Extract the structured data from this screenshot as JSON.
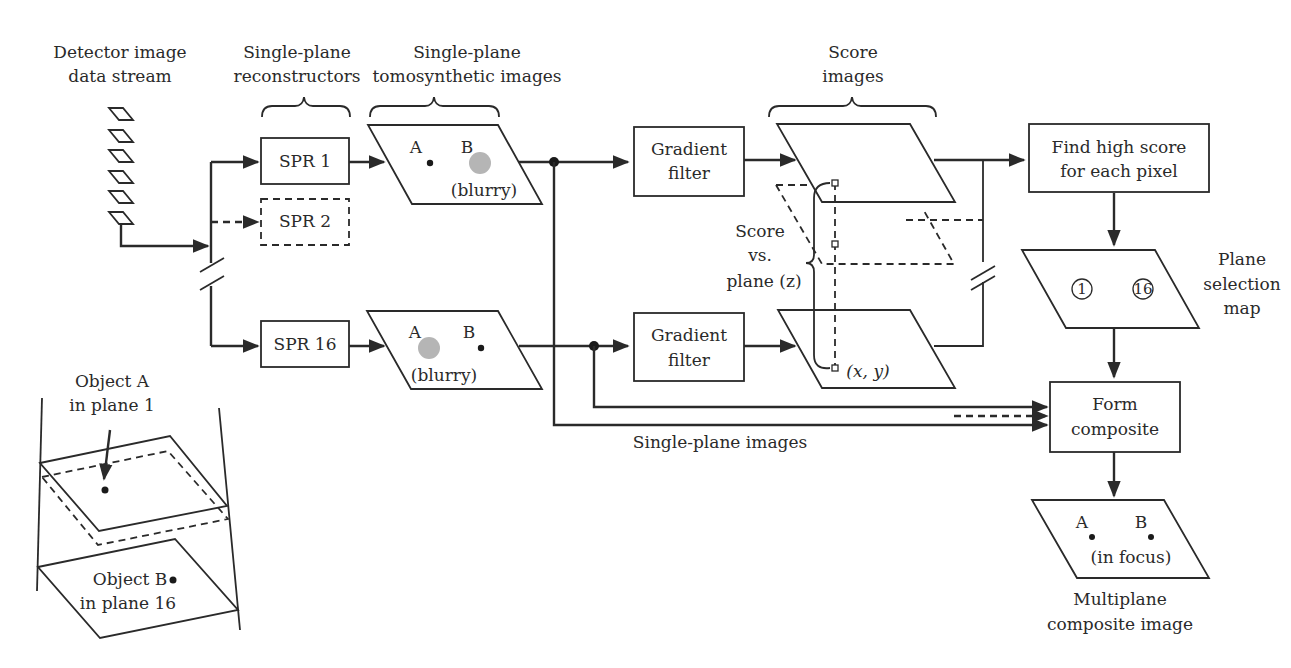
{
  "diagram": {
    "type": "flowchart",
    "headers": {
      "detector": [
        "Detector image",
        "data stream"
      ],
      "reconstructors": [
        "Single-plane",
        "reconstructors"
      ],
      "tomosynthetic": [
        "Single-plane",
        "tomosynthetic images"
      ],
      "score_images": [
        "Score",
        "images"
      ]
    },
    "spr_boxes": {
      "spr1": "SPR 1",
      "spr2": "SPR 2",
      "spr16": "SPR 16"
    },
    "tomo_images": {
      "top": {
        "label_a": "A",
        "label_b": "B",
        "note": "(blurry)"
      },
      "bottom": {
        "label_a": "A",
        "label_b": "B",
        "note": "(blurry)"
      }
    },
    "gradient_filters": {
      "top": [
        "Gradient",
        "filter"
      ],
      "bottom": [
        "Gradient",
        "filter"
      ]
    },
    "score_annotation": {
      "text": [
        "Score",
        "vs.",
        "plane (z)"
      ],
      "coord": "(x, y)"
    },
    "find_high_score": [
      "Find high score",
      "for each pixel"
    ],
    "plane_selection": {
      "label": [
        "Plane",
        "selection",
        "map"
      ],
      "circle_1": "1",
      "circle_16": "16"
    },
    "form_composite": [
      "Form",
      "composite"
    ],
    "single_plane_images_label": "Single-plane images",
    "composite_image": {
      "label_a": "A",
      "label_b": "B",
      "note": "(in focus)",
      "caption": [
        "Multiplane",
        "composite image"
      ]
    },
    "inset": {
      "object_a": [
        "Object A",
        "in plane 1"
      ],
      "object_b": [
        "Object B",
        "in plane 16"
      ]
    }
  }
}
